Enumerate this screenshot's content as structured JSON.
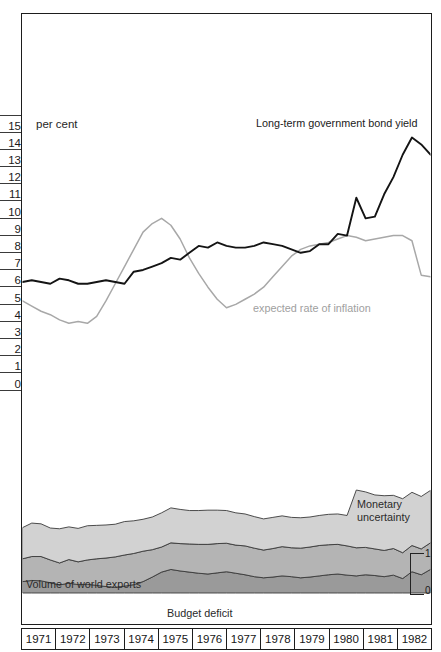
{
  "figure": {
    "unit_label": "per cent",
    "y_axis": {
      "ticks": [
        "15",
        "14",
        "13",
        "12",
        "11",
        "10",
        "9",
        "8",
        "7",
        "6",
        "5",
        "4",
        "3",
        "2",
        "1",
        "0"
      ],
      "min": 0,
      "max": 15
    },
    "right_scale": {
      "high": "1",
      "low": "0"
    },
    "years": [
      "1971",
      "1972",
      "1973",
      "1974",
      "1975",
      "1976",
      "1977",
      "1978",
      "1979",
      "1980",
      "1981",
      "1982"
    ],
    "labels": {
      "bond_yield": "Long-term government bond yield",
      "inflation": "expected rate of inflation",
      "world_exports": "Volume of world exports",
      "budget_deficit": "Budget deficit",
      "monetary_line1": "Monetary",
      "monetary_line2": "uncertainty"
    },
    "colors": {
      "bond_line": "#141414",
      "inflation_line": "#a8a8a8",
      "monetary_band": "#d2d2d2",
      "exports_band": "#b4b4b4",
      "deficit_band": "#9a9a9a",
      "frame": "#1d1d1d"
    }
  },
  "chart_data": {
    "type": "line",
    "title": "",
    "subtitle": "",
    "xlabel": "",
    "ylabel": "per cent",
    "ylim": [
      0,
      15
    ],
    "xlim": [
      1971,
      1982
    ],
    "grid": false,
    "legend": "inline-annotations",
    "x_tick_labels": [
      "1971",
      "1972",
      "1973",
      "1974",
      "1975",
      "1976",
      "1977",
      "1978",
      "1979",
      "1980",
      "1981",
      "1982"
    ],
    "y_tick_labels": [
      "0",
      "1",
      "2",
      "3",
      "4",
      "5",
      "6",
      "7",
      "8",
      "9",
      "10",
      "11",
      "12",
      "13",
      "14",
      "15"
    ],
    "x": [
      1971.0,
      1971.25,
      1971.5,
      1971.75,
      1972.0,
      1972.25,
      1972.5,
      1972.75,
      1973.0,
      1973.25,
      1973.5,
      1973.75,
      1974.0,
      1974.25,
      1974.5,
      1974.75,
      1975.0,
      1975.25,
      1975.5,
      1975.75,
      1976.0,
      1976.25,
      1976.5,
      1976.75,
      1977.0,
      1977.25,
      1977.5,
      1977.75,
      1978.0,
      1978.25,
      1978.5,
      1978.75,
      1979.0,
      1979.25,
      1979.5,
      1979.75,
      1980.0,
      1980.25,
      1980.5,
      1980.75,
      1981.0,
      1981.25,
      1981.5,
      1981.75,
      1982.0
    ],
    "series": [
      {
        "name": "Long-term government bond yield",
        "color": "#141414",
        "values": [
          5.9,
          6.0,
          5.9,
          5.8,
          6.1,
          6.0,
          5.8,
          5.8,
          5.9,
          6.0,
          5.9,
          5.8,
          6.5,
          6.6,
          6.8,
          7.0,
          7.3,
          7.2,
          7.6,
          8.0,
          7.9,
          8.2,
          8.0,
          7.9,
          7.9,
          8.0,
          8.2,
          8.1,
          8.0,
          7.8,
          7.6,
          7.7,
          8.1,
          8.1,
          8.7,
          8.6,
          10.8,
          9.6,
          9.7,
          11.0,
          12.0,
          13.3,
          14.3,
          13.9,
          13.3
        ]
      },
      {
        "name": "expected rate of inflation",
        "color": "#a8a8a8",
        "values": [
          4.8,
          4.5,
          4.2,
          4.0,
          3.7,
          3.5,
          3.6,
          3.5,
          3.9,
          4.8,
          5.8,
          6.8,
          7.8,
          8.8,
          9.3,
          9.6,
          9.2,
          8.4,
          7.3,
          6.4,
          5.6,
          4.9,
          4.4,
          4.6,
          4.9,
          5.2,
          5.6,
          6.2,
          6.8,
          7.4,
          7.8,
          8.0,
          8.1,
          8.2,
          8.4,
          8.6,
          8.5,
          8.3,
          8.4,
          8.5,
          8.6,
          8.6,
          8.3,
          6.3,
          6.2
        ]
      }
    ],
    "stacked_bands": {
      "scale_label": "index 0 to 1 (right-hand bracket)",
      "x": [
        1971.0,
        1971.25,
        1971.5,
        1971.75,
        1972.0,
        1972.25,
        1972.5,
        1972.75,
        1973.0,
        1973.25,
        1973.5,
        1973.75,
        1974.0,
        1974.25,
        1974.5,
        1974.75,
        1975.0,
        1975.25,
        1975.5,
        1975.75,
        1976.0,
        1976.25,
        1976.5,
        1976.75,
        1977.0,
        1977.25,
        1977.5,
        1977.75,
        1978.0,
        1978.25,
        1978.5,
        1978.75,
        1979.0,
        1979.25,
        1979.5,
        1979.75,
        1980.0,
        1980.25,
        1980.5,
        1980.75,
        1981.0,
        1981.25,
        1981.5,
        1981.75,
        1982.0
      ],
      "bands": [
        {
          "name": "Budget deficit",
          "color": "#9a9a9a",
          "values": [
            0.3,
            0.33,
            0.32,
            0.27,
            0.21,
            0.26,
            0.22,
            0.23,
            0.2,
            0.17,
            0.15,
            0.18,
            0.22,
            0.3,
            0.42,
            0.55,
            0.62,
            0.58,
            0.55,
            0.52,
            0.5,
            0.53,
            0.56,
            0.52,
            0.48,
            0.43,
            0.4,
            0.42,
            0.45,
            0.43,
            0.4,
            0.42,
            0.45,
            0.48,
            0.5,
            0.47,
            0.45,
            0.48,
            0.46,
            0.43,
            0.47,
            0.38,
            0.56,
            0.48,
            0.62
          ]
        },
        {
          "name": "Volume of world exports",
          "color": "#b4b4b4",
          "values": [
            0.6,
            0.63,
            0.64,
            0.6,
            0.58,
            0.62,
            0.6,
            0.64,
            0.7,
            0.75,
            0.8,
            0.82,
            0.82,
            0.8,
            0.72,
            0.66,
            0.7,
            0.72,
            0.74,
            0.76,
            0.78,
            0.77,
            0.75,
            0.74,
            0.76,
            0.75,
            0.73,
            0.75,
            0.77,
            0.76,
            0.78,
            0.79,
            0.8,
            0.79,
            0.78,
            0.77,
            0.74,
            0.72,
            0.7,
            0.69,
            0.7,
            0.68,
            0.69,
            0.68,
            0.7
          ]
        },
        {
          "name": "Monetary uncertainty",
          "color": "#d2d2d2",
          "values": [
            0.82,
            0.88,
            0.86,
            0.84,
            0.9,
            0.86,
            0.88,
            0.9,
            0.88,
            0.87,
            0.86,
            0.88,
            0.86,
            0.84,
            0.86,
            0.9,
            0.92,
            0.9,
            0.88,
            0.89,
            0.9,
            0.88,
            0.86,
            0.85,
            0.84,
            0.83,
            0.82,
            0.82,
            0.81,
            0.8,
            0.8,
            0.79,
            0.79,
            0.8,
            0.8,
            0.8,
            1.52,
            1.46,
            1.42,
            1.44,
            1.4,
            1.42,
            1.4,
            1.38,
            1.38
          ]
        }
      ]
    }
  }
}
